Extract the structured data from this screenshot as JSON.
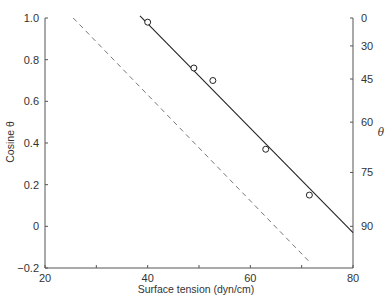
{
  "chart_data": {
    "type": "scatter",
    "title": "",
    "xlabel": "Surface tension (dyn/cm)",
    "ylabel": "Cosine θ",
    "y2label": "θ",
    "xlim": [
      20,
      80
    ],
    "ylim": [
      -0.2,
      1.0
    ],
    "grid": false,
    "legend": null,
    "x_ticks": [
      20,
      40,
      60,
      80
    ],
    "x_minor_ticks": [
      30,
      50,
      70
    ],
    "y_ticks": [
      -0.2,
      0,
      0.2,
      0.4,
      0.6,
      0.8,
      1.0
    ],
    "y_tick_labels": [
      "−0.2",
      "0",
      "0.2",
      "0.4",
      "0.6",
      "0.8",
      "1.0"
    ],
    "y2_ticks": [
      0,
      30,
      45,
      60,
      75,
      90
    ],
    "y2_scale": "cosine",
    "series": [
      {
        "name": "measured points",
        "style": "open-circle",
        "x": [
          40,
          49,
          52.7,
          63,
          71.5
        ],
        "y": [
          0.98,
          0.76,
          0.7,
          0.37,
          0.15
        ]
      },
      {
        "name": "fit line",
        "style": "solid-line",
        "x": [
          38.5,
          80
        ],
        "y": [
          1.01,
          -0.03
        ]
      },
      {
        "name": "reference line",
        "style": "dashed-line",
        "x": [
          25.5,
          71.5
        ],
        "y": [
          1.0,
          -0.17
        ]
      }
    ]
  }
}
